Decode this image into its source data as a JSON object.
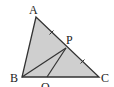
{
  "diagram": {
    "type": "geometry-triangle",
    "fill_color": "#cfcfcf",
    "stroke_color": "#333333",
    "points": {
      "A": {
        "label": "A",
        "x": 36,
        "y": 17
      },
      "B": {
        "label": "B",
        "x": 22,
        "y": 77
      },
      "C": {
        "label": "C",
        "x": 99,
        "y": 77
      },
      "P": {
        "label": "P",
        "x": 66,
        "y": 48
      },
      "Q": {
        "label": "Q",
        "x": 47,
        "y": 77
      }
    },
    "segments": [
      "AB",
      "AC",
      "BC",
      "BP",
      "PQ"
    ],
    "equal_marks": [
      "AP",
      "PC"
    ]
  }
}
